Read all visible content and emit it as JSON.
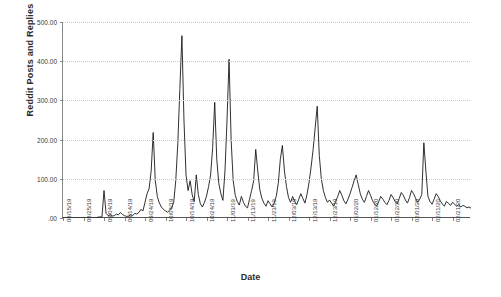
{
  "chart_data": {
    "type": "line",
    "title": "",
    "xlabel": "Date",
    "ylabel": "Reddit Posts and Replies",
    "ylim": [
      0,
      500
    ],
    "grid": true,
    "legend": "none",
    "y_ticks": [
      {
        "value": 500,
        "label": "500.00"
      },
      {
        "value": 400,
        "label": "400.00"
      },
      {
        "value": 300,
        "label": "300.00"
      },
      {
        "value": 200,
        "label": "200.00"
      },
      {
        "value": 100,
        "label": "100.00"
      },
      {
        "value": 0,
        "label": ".00"
      }
    ],
    "x_ticks": [
      {
        "index": 0,
        "label": "08/15/19"
      },
      {
        "index": 10,
        "label": "08/25/19"
      },
      {
        "index": 20,
        "label": "09/04/19"
      },
      {
        "index": 30,
        "label": "09/14/19"
      },
      {
        "index": 40,
        "label": "09/24/19"
      },
      {
        "index": 50,
        "label": "10/04/19"
      },
      {
        "index": 60,
        "label": "10/14/19"
      },
      {
        "index": 70,
        "label": "10/24/19"
      },
      {
        "index": 80,
        "label": "11/03/19"
      },
      {
        "index": 90,
        "label": "11/13/19"
      },
      {
        "index": 100,
        "label": "11/23/19"
      },
      {
        "index": 110,
        "label": "12/03/19"
      },
      {
        "index": 120,
        "label": "12/13/19"
      },
      {
        "index": 130,
        "label": "12/23/19"
      },
      {
        "index": 140,
        "label": "01/02/20"
      },
      {
        "index": 150,
        "label": "01/12/20"
      },
      {
        "index": 160,
        "label": "01/22/20"
      },
      {
        "index": 170,
        "label": "02/01/20"
      },
      {
        "index": 180,
        "label": "02/11/20"
      },
      {
        "index": 190,
        "label": "02/21/20"
      }
    ],
    "x_start": "08/15/19",
    "x_end": "02/21/20",
    "series": [
      {
        "name": "Reddit Posts and Replies",
        "color": "#1a1a1a",
        "values": [
          0,
          0,
          0,
          0,
          0,
          0,
          0,
          0,
          0,
          0,
          0,
          0,
          0,
          0,
          0,
          0,
          0,
          2,
          3,
          2,
          70,
          12,
          6,
          8,
          5,
          6,
          10,
          8,
          14,
          9,
          6,
          4,
          5,
          8,
          6,
          12,
          10,
          14,
          22,
          18,
          40,
          62,
          75,
          120,
          218,
          96,
          55,
          38,
          28,
          22,
          18,
          15,
          20,
          26,
          40,
          95,
          190,
          330,
          465,
          250,
          110,
          70,
          95,
          60,
          42,
          110,
          60,
          36,
          28,
          40,
          56,
          80,
          110,
          180,
          295,
          150,
          88,
          62,
          45,
          120,
          250,
          405,
          200,
          96,
          58,
          42,
          33,
          55,
          40,
          30,
          26,
          48,
          70,
          95,
          175,
          120,
          72,
          50,
          38,
          30,
          44,
          36,
          28,
          38,
          55,
          88,
          150,
          185,
          120,
          80,
          52,
          40,
          55,
          42,
          34,
          48,
          62,
          50,
          38,
          60,
          90,
          130,
          175,
          230,
          285,
          160,
          100,
          70,
          52,
          40,
          46,
          38,
          30,
          42,
          55,
          70,
          58,
          44,
          36,
          48,
          62,
          78,
          95,
          110,
          85,
          62,
          48,
          40,
          55,
          70,
          58,
          44,
          36,
          30,
          42,
          55,
          48,
          40,
          34,
          45,
          60,
          52,
          42,
          36,
          50,
          65,
          58,
          46,
          38,
          52,
          70,
          62,
          50,
          40,
          48,
          60,
          192,
          120,
          55,
          42,
          35,
          48,
          62,
          55,
          44,
          36,
          30,
          42,
          38,
          32,
          40,
          35,
          30,
          34,
          28,
          32,
          30,
          26,
          28,
          25
        ]
      }
    ]
  }
}
